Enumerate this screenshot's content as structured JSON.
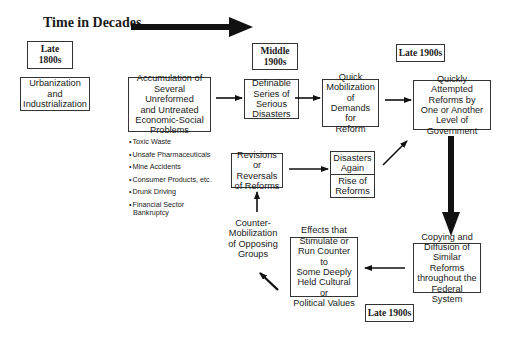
{
  "title": "Time in Decades",
  "eras": {
    "late_1800s": "Late\n1800s",
    "middle_1900s": "Middle\n1900s",
    "late_1900s_top": "Late 1900s",
    "late_1900s_bottom": "Late 1900s"
  },
  "nodes": {
    "urbanization": "Urbanization\nand\nIndustrialization",
    "accumulation": "Accumulation of\nSeveral Unreformed\nand Untreated\nEconomic-Social\nProblems",
    "disasters": "Definable\nSeries of\nSerious\nDisasters",
    "mobilization": "Quick\nMobilization\nof\nDemands for\nReform",
    "attempted_reforms": "Quickly Attempted\nReforms by\nOne or Another\nLevel of\nGovernment",
    "copying": "Copying and\nDiffusion of\nSimilar Reforms\nthroughout the\nFederal System",
    "effects": "Effects that\nStimulate or\nRun Counter to\nSome Deeply\nHeld Cultural or\nPolitical Values",
    "counter_mobilization": "Counter-\nMobilization\nof Opposing\nGroups",
    "revisions": "Revisions\nor Reversals\nof Reforms",
    "disasters_again": "Disasters\nAgain",
    "rise_of_reforms": "Rise of\nReforms"
  },
  "problem_examples": [
    "Toxic Waste",
    "Unsafe Pharmaceuticals",
    "Mine Accidents",
    "Consumer Products, etc.",
    "Drunk Driving",
    "Financial Sector Bankruptcy"
  ]
}
